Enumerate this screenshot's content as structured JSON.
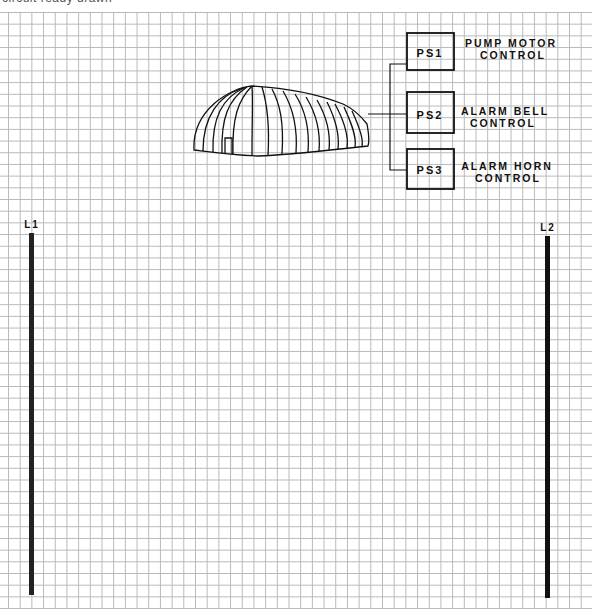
{
  "caption": "circuit ready drawn",
  "background": "graph-paper-grid",
  "rails": {
    "left": {
      "label": "L1"
    },
    "right": {
      "label": "L2"
    }
  },
  "building": {
    "description": "quonset-style arched building with door",
    "icon": "building-icon"
  },
  "switches": [
    {
      "id": "PS1",
      "label_line1": "PUMP MOTOR",
      "label_line2": "CONTROL"
    },
    {
      "id": "PS2",
      "label_line1": "ALARM BELL",
      "label_line2": "CONTROL"
    },
    {
      "id": "PS3",
      "label_line1": "ALARM HORN",
      "label_line2": "CONTROL"
    }
  ],
  "colors": {
    "ink": "#111111",
    "grid": "#b8b8b8"
  }
}
